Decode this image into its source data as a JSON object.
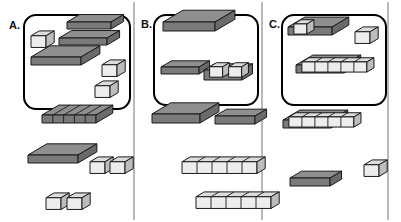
{
  "figure": {
    "background_color": "#ffffff",
    "width": 401,
    "height": 222,
    "panel_divider_color": "#8a8a8a",
    "dividers_x": [
      134,
      262,
      388
    ],
    "box_border_color": "#000000",
    "box_fill_color": "#ffffff",
    "colors": {
      "dark_top": "#8f8f8f",
      "dark_front": "#7a7a7a",
      "dark_side": "#6a6a6a",
      "dark_outline": "#1a1a1a",
      "light_top": "#dcdcdc",
      "light_front": "#ededed",
      "light_side": "#bdbdbd",
      "light_outline": "#1a1a1a",
      "divider_line": "#8a8a8a"
    }
  },
  "panels": [
    {
      "id": "A",
      "label": "A.",
      "label_x": 9,
      "label_y": 29,
      "box": {
        "x": 24,
        "y": 15,
        "width": 106,
        "height": 94,
        "radius": 12
      },
      "inside_box": [
        {
          "name": "unit-cube",
          "kind": "cube",
          "fill": "light",
          "x": 31,
          "y": 29,
          "size": 15
        },
        {
          "name": "stepped-slab-upper",
          "kind": "slab",
          "fill": "dark",
          "x": 67,
          "y": 22,
          "w": 44,
          "d": 12,
          "h": 7
        },
        {
          "name": "stepped-slab-lower",
          "kind": "slab",
          "fill": "dark",
          "x": 59,
          "y": 38,
          "w": 48,
          "d": 12,
          "h": 7
        },
        {
          "name": "big-slab",
          "kind": "slab",
          "fill": "dark",
          "x": 31,
          "y": 57,
          "w": 50,
          "d": 18,
          "h": 8
        },
        {
          "name": "unit-cube",
          "kind": "cube",
          "fill": "light",
          "x": 102,
          "y": 58,
          "size": 15
        },
        {
          "name": "unit-cube",
          "kind": "cube",
          "fill": "light",
          "x": 95,
          "y": 79,
          "size": 15
        }
      ],
      "outside_box": [
        {
          "name": "segmented-dark-slab",
          "kind": "segmented-slab",
          "fill": "dark",
          "segments": 5,
          "x": 42,
          "y": 115,
          "w": 54,
          "d": 16,
          "h": 8
        },
        {
          "name": "big-slab",
          "kind": "slab",
          "fill": "dark",
          "x": 28,
          "y": 155,
          "w": 50,
          "d": 18,
          "h": 8
        },
        {
          "name": "unit-cube",
          "kind": "cube",
          "fill": "light",
          "x": 90,
          "y": 155,
          "size": 15
        },
        {
          "name": "unit-cube",
          "kind": "cube",
          "fill": "light",
          "x": 110,
          "y": 155,
          "size": 15
        },
        {
          "name": "unit-cube",
          "kind": "cube",
          "fill": "light",
          "x": 46,
          "y": 191,
          "size": 15
        },
        {
          "name": "unit-cube",
          "kind": "cube",
          "fill": "light",
          "x": 67,
          "y": 191,
          "size": 15
        }
      ]
    },
    {
      "id": "B",
      "label": "B.",
      "label_x": 141,
      "label_y": 28,
      "box": {
        "x": 154,
        "y": 15,
        "width": 104,
        "height": 90,
        "radius": 12
      },
      "inside_box": [
        {
          "name": "big-slab",
          "kind": "slab",
          "fill": "dark",
          "x": 163,
          "y": 22,
          "w": 52,
          "d": 19,
          "h": 9
        },
        {
          "name": "small-bar",
          "kind": "slab",
          "fill": "dark",
          "x": 161,
          "y": 67,
          "w": 38,
          "d": 10,
          "h": 7
        },
        {
          "name": "bar-with-two-cubes",
          "kind": "bar-cubes",
          "fill": "dark",
          "cubes": 2,
          "x": 204,
          "y": 60,
          "w": 38,
          "d": 10,
          "h": 7
        }
      ],
      "outside_box": [
        {
          "name": "big-slab",
          "kind": "slab",
          "fill": "dark",
          "x": 152,
          "y": 114,
          "w": 48,
          "d": 18,
          "h": 9
        },
        {
          "name": "small-bar",
          "kind": "slab",
          "fill": "dark",
          "x": 215,
          "y": 116,
          "w": 40,
          "d": 11,
          "h": 8
        },
        {
          "name": "light-cube-row",
          "kind": "cube-row",
          "fill": "light",
          "cubes": 5,
          "x": 182,
          "y": 155,
          "size": 15
        },
        {
          "name": "light-cube-row",
          "kind": "cube-row",
          "fill": "light",
          "cubes": 5,
          "x": 196,
          "y": 190,
          "size": 15
        }
      ]
    },
    {
      "id": "C",
      "label": "C.",
      "label_x": 269,
      "label_y": 28,
      "box": {
        "x": 282,
        "y": 15,
        "width": 104,
        "height": 90,
        "radius": 12
      },
      "inside_box": [
        {
          "name": "slab-with-one-cube",
          "kind": "slab-cubes",
          "fill": "dark",
          "cubes": 1,
          "x": 288,
          "y": 27,
          "w": 44,
          "d": 16,
          "h": 8
        },
        {
          "name": "unit-cube",
          "kind": "cube",
          "fill": "light",
          "x": 355,
          "y": 25,
          "size": 15
        },
        {
          "name": "slab-with-five-cubes",
          "kind": "slab-cubes",
          "fill": "dark",
          "cubes": 5,
          "x": 296,
          "y": 65,
          "w": 48,
          "d": 16,
          "h": 8
        }
      ],
      "outside_box": [
        {
          "name": "slab-with-five-cubes",
          "kind": "slab-cubes",
          "fill": "dark",
          "cubes": 5,
          "x": 283,
          "y": 120,
          "w": 48,
          "d": 16,
          "h": 8
        },
        {
          "name": "unit-cube",
          "kind": "cube",
          "fill": "light",
          "x": 364,
          "y": 158,
          "size": 15
        },
        {
          "name": "small-bar",
          "kind": "slab",
          "fill": "dark",
          "x": 290,
          "y": 178,
          "w": 40,
          "d": 11,
          "h": 8
        }
      ]
    }
  ]
}
